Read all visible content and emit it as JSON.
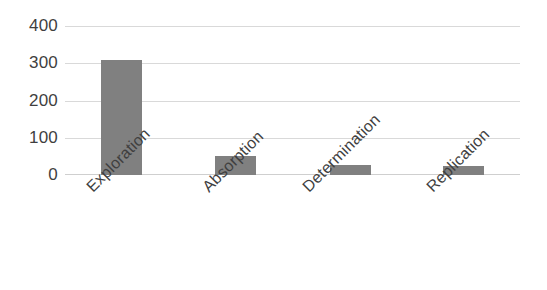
{
  "chart_data": {
    "type": "bar",
    "title": "",
    "subtitle": "",
    "xlabel": "",
    "ylabel": "",
    "categories": [
      "Exploration",
      "Absorption",
      "Determination",
      "Replication"
    ],
    "values": [
      310,
      50,
      27,
      25
    ],
    "series": [
      {
        "name": "",
        "values": [
          310,
          50,
          27,
          25
        ]
      }
    ],
    "ylim": [
      0,
      400
    ],
    "y_ticks": [
      0,
      100,
      200,
      300,
      400
    ],
    "y_tick_labels": [
      "0",
      "100",
      "200",
      "300",
      "400"
    ],
    "grid": true,
    "grid_axis": "y",
    "legend": false,
    "legend_position": "none",
    "x_tick_label_rotation": -45,
    "bar_color": "#808080",
    "gridline_color": "#d9d9d9",
    "axis_label_color": "#3f3f3f",
    "background_color": "#ffffff",
    "annotations": []
  },
  "axis": {
    "y": {
      "tick_0": "0",
      "tick_1": "100",
      "tick_2": "200",
      "tick_3": "300",
      "tick_4": "400"
    },
    "x": {
      "tick_0": "Exploration",
      "tick_1": "Absorption",
      "tick_2": "Determination",
      "tick_3": "Replication"
    }
  }
}
